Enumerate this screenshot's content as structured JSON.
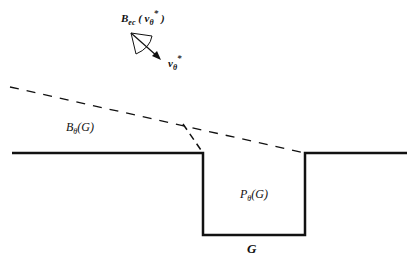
{
  "diagram": {
    "labels": {
      "cone_label": {
        "main": "B",
        "sub": "ec",
        "open": " ( v",
        "vsub": "θ",
        "vsup": "*",
        "close": " )"
      },
      "velocity_label": {
        "main": "v",
        "sub": "θ",
        "sup": "*"
      },
      "ballistic_region": {
        "main": "B",
        "sub": "θ",
        "rest": "(G)"
      },
      "pit_region": {
        "main": "P",
        "sub": "θ",
        "rest": "(G)"
      },
      "gap_label": "G"
    },
    "colors": {
      "stroke": "#111111",
      "background": "#ffffff"
    }
  }
}
